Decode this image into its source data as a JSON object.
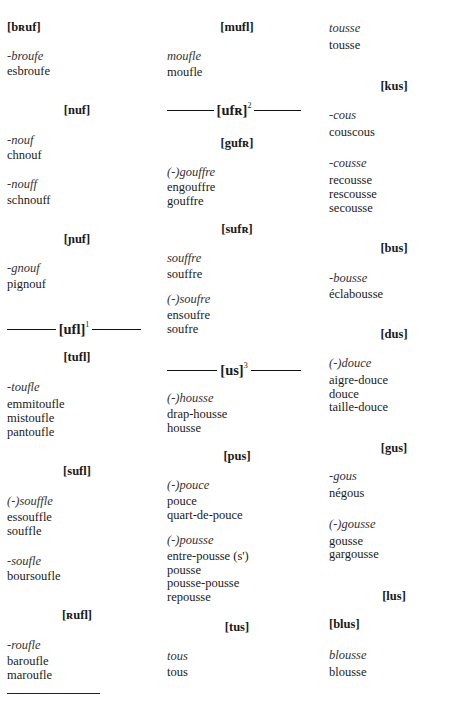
{
  "columns": [
    {
      "id": "left",
      "blocks": [
        {
          "type": "header",
          "text": "[bʀuf]",
          "align": "left",
          "top": 20
        },
        {
          "type": "pattern",
          "text": "-broufe",
          "top": 49
        },
        {
          "type": "word",
          "text": "esbroufe",
          "top": 64
        },
        {
          "type": "header",
          "text": "[nuf]",
          "align": "center",
          "top": 103
        },
        {
          "type": "pattern",
          "text": "-nouf",
          "top": 133
        },
        {
          "type": "word",
          "text": "chnouf",
          "top": 148
        },
        {
          "type": "pattern",
          "text": "-nouff",
          "top": 177
        },
        {
          "type": "word",
          "text": "schnouff",
          "top": 193
        },
        {
          "type": "header",
          "text": "[ɲuf]",
          "align": "center",
          "top": 232
        },
        {
          "type": "pattern",
          "text": "-gnouf",
          "top": 261
        },
        {
          "type": "word",
          "text": "pignouf",
          "top": 277
        },
        {
          "type": "rule-header",
          "text": "[ufl]",
          "sup": "1",
          "top": 320
        },
        {
          "type": "header",
          "text": "[tufl]",
          "align": "center",
          "top": 350
        },
        {
          "type": "pattern",
          "text": "-toufle",
          "top": 380
        },
        {
          "type": "word",
          "text": "emmitoufle",
          "top": 397
        },
        {
          "type": "word",
          "text": "mistoufle",
          "top": 411
        },
        {
          "type": "word",
          "text": "pantoufle",
          "top": 425
        },
        {
          "type": "header",
          "text": "[sufl]",
          "align": "center",
          "top": 464
        },
        {
          "type": "pattern",
          "text": "(-)souffle",
          "top": 494
        },
        {
          "type": "word",
          "text": "essouffle",
          "top": 510
        },
        {
          "type": "word",
          "text": "souffle",
          "top": 524
        },
        {
          "type": "pattern",
          "text": "-soufle",
          "top": 554
        },
        {
          "type": "word",
          "text": "boursoufle",
          "top": 569
        },
        {
          "type": "header",
          "text": "[ʀufl]",
          "align": "center",
          "top": 608
        },
        {
          "type": "pattern",
          "text": "-roufle",
          "top": 638
        },
        {
          "type": "word",
          "text": "baroufle",
          "top": 654
        },
        {
          "type": "word",
          "text": "maroufle",
          "top": 668
        }
      ]
    },
    {
      "id": "mid",
      "blocks": [
        {
          "type": "header",
          "text": "[mufl]",
          "align": "center",
          "top": 20
        },
        {
          "type": "pattern",
          "text": "moufle",
          "top": 49
        },
        {
          "type": "word",
          "text": "moufle",
          "top": 65
        },
        {
          "type": "rule-header",
          "text": "[ufʀ]",
          "sup": "2",
          "top": 101
        },
        {
          "type": "header",
          "text": "[gufʀ]",
          "align": "center",
          "top": 136
        },
        {
          "type": "pattern",
          "text": "(-)gouffre",
          "top": 165
        },
        {
          "type": "word",
          "text": "engouffre",
          "top": 180
        },
        {
          "type": "word",
          "text": "gouffre",
          "top": 194
        },
        {
          "type": "header",
          "text": "[sufʀ]",
          "align": "center",
          "top": 222
        },
        {
          "type": "pattern",
          "text": "souffre",
          "top": 251
        },
        {
          "type": "word",
          "text": "souffre",
          "top": 267
        },
        {
          "type": "pattern",
          "text": "(-)soufre",
          "top": 292
        },
        {
          "type": "word",
          "text": "ensoufre",
          "top": 308
        },
        {
          "type": "word",
          "text": "soufre",
          "top": 322
        },
        {
          "type": "rule-header",
          "text": "[us]",
          "sup": "3",
          "top": 361
        },
        {
          "type": "pattern",
          "text": "(-)housse",
          "top": 391
        },
        {
          "type": "word",
          "text": "drap-housse",
          "top": 407
        },
        {
          "type": "word",
          "text": "housse",
          "top": 421
        },
        {
          "type": "header",
          "text": "[pus]",
          "align": "center",
          "top": 449
        },
        {
          "type": "pattern",
          "text": "(-)pouce",
          "top": 478
        },
        {
          "type": "word",
          "text": "pouce",
          "top": 494
        },
        {
          "type": "word",
          "text": "quart-de-pouce",
          "top": 508
        },
        {
          "type": "pattern",
          "text": "(-)pousse",
          "top": 533
        },
        {
          "type": "word",
          "text": "entre-pousse (s')",
          "top": 549
        },
        {
          "type": "word",
          "text": "pousse",
          "top": 563
        },
        {
          "type": "word",
          "text": "pousse-pousse",
          "top": 576
        },
        {
          "type": "word",
          "text": "repousse",
          "top": 590
        },
        {
          "type": "header",
          "text": "[tus]",
          "align": "center",
          "top": 620
        },
        {
          "type": "pattern",
          "text": "tous",
          "top": 649
        },
        {
          "type": "word",
          "text": "tous",
          "top": 665
        }
      ]
    },
    {
      "id": "right",
      "blocks": [
        {
          "type": "pattern",
          "text": "tousse",
          "top": 21
        },
        {
          "type": "word",
          "text": "tousse",
          "top": 38
        },
        {
          "type": "header",
          "text": "[kus]",
          "align": "center",
          "top": 79
        },
        {
          "type": "pattern",
          "text": "-cous",
          "top": 108
        },
        {
          "type": "word",
          "text": "couscous",
          "top": 125
        },
        {
          "type": "pattern",
          "text": "-cousse",
          "top": 156
        },
        {
          "type": "word",
          "text": "recousse",
          "top": 173
        },
        {
          "type": "word",
          "text": "rescousse",
          "top": 187
        },
        {
          "type": "word",
          "text": "secousse",
          "top": 201
        },
        {
          "type": "header",
          "text": "[bus]",
          "align": "center",
          "top": 241
        },
        {
          "type": "pattern",
          "text": "-bousse",
          "top": 271
        },
        {
          "type": "word",
          "text": "éclabousse",
          "top": 287
        },
        {
          "type": "header",
          "text": "[dus]",
          "align": "center",
          "top": 327
        },
        {
          "type": "pattern",
          "text": "(-)douce",
          "top": 356
        },
        {
          "type": "word",
          "text": "aigre-douce",
          "top": 373
        },
        {
          "type": "word",
          "text": "douce",
          "top": 387
        },
        {
          "type": "word",
          "text": "taille-douce",
          "top": 400
        },
        {
          "type": "header",
          "text": "[gus]",
          "align": "center",
          "top": 441
        },
        {
          "type": "pattern",
          "text": "-gous",
          "top": 469
        },
        {
          "type": "word",
          "text": "négous",
          "top": 486
        },
        {
          "type": "pattern",
          "text": "(-)gousse",
          "top": 517
        },
        {
          "type": "word",
          "text": "gousse",
          "top": 534
        },
        {
          "type": "word",
          "text": "gargousse",
          "top": 547
        },
        {
          "type": "header",
          "text": "[lus]",
          "align": "center",
          "top": 589
        },
        {
          "type": "header",
          "text": "[blus]",
          "align": "left",
          "top": 617
        },
        {
          "type": "pattern",
          "text": "blousse",
          "top": 648
        },
        {
          "type": "word",
          "text": "blousse",
          "top": 665
        }
      ]
    }
  ],
  "footnote": {
    "visible_text": ""
  }
}
